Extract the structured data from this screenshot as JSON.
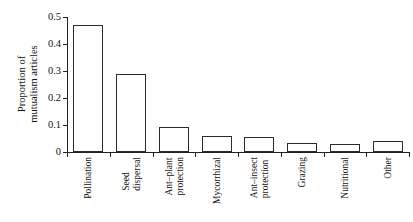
{
  "chart_data": {
    "type": "bar",
    "title": "",
    "xlabel": "",
    "ylabel": "Proportion of mutualism articles",
    "ylabel_lines": [
      "Proportion of",
      "mutualism articles"
    ],
    "categories": [
      "Pollination",
      "Seed dispersal",
      "Ant–plant protection",
      "Mycorrhizal",
      "Ant–insect protection",
      "Grazing",
      "Nutritional",
      "Other"
    ],
    "category_lines": [
      [
        "Pollination"
      ],
      [
        "Seed",
        "dispersal"
      ],
      [
        "Ant–plant",
        "protection"
      ],
      [
        "Mycorrhizal"
      ],
      [
        "Ant–insect",
        "protection"
      ],
      [
        "Grazing"
      ],
      [
        "Nutritional"
      ],
      [
        "Other"
      ]
    ],
    "values": [
      0.47,
      0.29,
      0.093,
      0.059,
      0.056,
      0.033,
      0.029,
      0.041
    ],
    "ylim": [
      0,
      0.5
    ],
    "yticks": [
      0,
      0.1,
      0.2,
      0.3,
      0.4,
      0.5
    ],
    "ytick_labels": [
      "0",
      "0.1",
      "0.2",
      "0.3",
      "0.4",
      "0.5"
    ],
    "grid": false,
    "legend": null,
    "bar_facecolor": "#ffffff",
    "bar_edgecolor": "#2b2b2b",
    "axis_color": "#222222",
    "background": "#ffffff"
  }
}
